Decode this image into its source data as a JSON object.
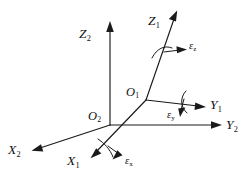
{
  "figure": {
    "type": "technical-line-diagram",
    "background_color": "#ffffff",
    "line_color": "#1a1a1a"
  },
  "frames": [
    {
      "id": "frame-1",
      "origin_label": "O",
      "origin_subscript": "1",
      "axes": [
        "X1",
        "Y1",
        "Z1"
      ]
    },
    {
      "id": "frame-2",
      "origin_label": "O",
      "origin_subscript": "2",
      "axes": [
        "X2",
        "Y2",
        "Z2"
      ]
    }
  ],
  "origins": {
    "o1": {
      "base": "O",
      "sub": "1"
    },
    "o2": {
      "base": "O",
      "sub": "2"
    }
  },
  "axis_labels": {
    "z2": {
      "base": "Z",
      "sub": "2"
    },
    "z1": {
      "base": "Z",
      "sub": "1"
    },
    "y1": {
      "base": "Y",
      "sub": "1"
    },
    "y2": {
      "base": "Y",
      "sub": "2"
    },
    "x1": {
      "base": "X",
      "sub": "1"
    },
    "x2": {
      "base": "X",
      "sub": "2"
    }
  },
  "rotation_labels": {
    "eps_z": {
      "base": "ε",
      "sub": "z"
    },
    "eps_y": {
      "base": "ε",
      "sub": "y"
    },
    "eps_x": {
      "base": "ε",
      "sub": "x"
    }
  }
}
